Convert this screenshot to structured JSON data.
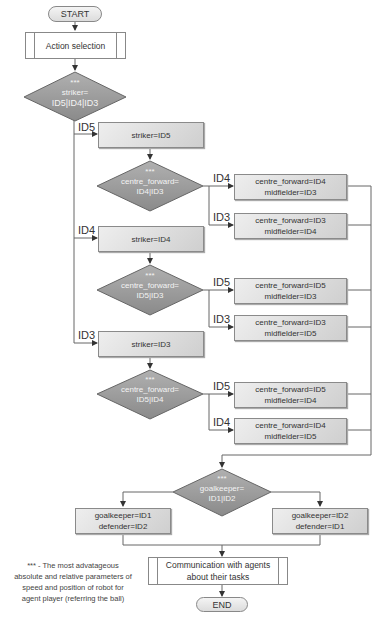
{
  "diagram": {
    "type": "flowchart",
    "start_label": "START",
    "end_label": "END",
    "action_selection": "Action selection",
    "marker": "***",
    "striker_decision": {
      "line1": "striker=",
      "line2": "ID5|ID4|ID3"
    },
    "branches": [
      {
        "edge_label": "ID5",
        "striker_box": "striker=ID5",
        "decision": {
          "line1": "centre_forward=",
          "line2": "ID4|ID3"
        },
        "outcomes": [
          {
            "edge_label": "ID4",
            "line1": "centre_forward=ID4",
            "line2": "midfielder=ID3"
          },
          {
            "edge_label": "ID3",
            "line1": "centre_forward=ID3",
            "line2": "midfielder=ID4"
          }
        ]
      },
      {
        "edge_label": "ID4",
        "striker_box": "striker=ID4",
        "decision": {
          "line1": "centre_forward=",
          "line2": "ID5|ID3"
        },
        "outcomes": [
          {
            "edge_label": "ID5",
            "line1": "centre_forward=ID5",
            "line2": "midfielder=ID3"
          },
          {
            "edge_label": "ID3",
            "line1": "centre_forward=ID3",
            "line2": "midfielder=ID5"
          }
        ]
      },
      {
        "edge_label": "ID3",
        "striker_box": "striker=ID3",
        "decision": {
          "line1": "centre_forward=",
          "line2": "ID5|ID4"
        },
        "outcomes": [
          {
            "edge_label": "ID5",
            "line1": "centre_forward=ID5",
            "line2": "midfielder=ID4"
          },
          {
            "edge_label": "ID4",
            "line1": "centre_forward=ID4",
            "line2": "midfielder=ID5"
          }
        ]
      }
    ],
    "goalkeeper_decision": {
      "line1": "goalkeeper=",
      "line2": "ID1|ID2"
    },
    "goalkeeper_outcomes": [
      {
        "line1": "goalkeeper=ID1",
        "line2": "defender=ID2"
      },
      {
        "line1": "goalkeeper=ID2",
        "line2": "defender=ID1"
      }
    ],
    "communication": {
      "line1": "Communication with agents",
      "line2": "about their tasks"
    },
    "footnote": {
      "line1": "*** - The most advatageous",
      "line2": "absolute and relative parameters of",
      "line3": "speed and position of robot for",
      "line4": "agent player (referring the ball)"
    },
    "colors": {
      "shape_fill": "#d4d4d4",
      "diamond_fill": "#9a9a9a",
      "line": "#666666",
      "text": "#333333"
    }
  }
}
